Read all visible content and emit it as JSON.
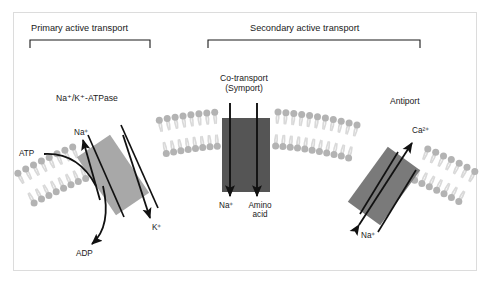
{
  "figure": {
    "background_color": "#ffffff",
    "border_color": "#dcdcdc"
  },
  "groups": [
    {
      "id": "primary",
      "label": "Primary active transport",
      "bracket": {
        "x1": 30,
        "x2": 150,
        "y": 40,
        "tick": 8
      }
    },
    {
      "id": "secondary",
      "label": "Secondary active transport",
      "bracket": {
        "x1": 208,
        "x2": 420,
        "y": 40,
        "tick": 8
      }
    }
  ],
  "proteins": [
    {
      "id": "na-k-atpase",
      "label": "Na⁺/K⁺-ATPase",
      "type": "pump",
      "color": "#a8a8a8",
      "label_x": 56,
      "label_y": 94
    },
    {
      "id": "symport",
      "label_line1": "Co-transport",
      "label_line2": "(Symport)",
      "type": "symporter",
      "color": "#555555",
      "label_x": 205,
      "label_y": 74
    },
    {
      "id": "antiport",
      "label": "Antiport",
      "type": "antiporter",
      "color": "#7a7a7a",
      "label_x": 390,
      "label_y": 97
    }
  ],
  "membrane": {
    "head_color": "#b3b3b3",
    "tail_color": "#d9d9d9",
    "description": "curved phospholipid bilayer arc"
  },
  "ions": [
    {
      "id": "atpase-na-out",
      "text": "Na⁺",
      "x": 74,
      "y": 128,
      "arrow": "up-left"
    },
    {
      "id": "atpase-k-in",
      "text": "K⁺",
      "x": 152,
      "y": 223,
      "arrow": "down-right"
    },
    {
      "id": "atp-in",
      "text": "ATP",
      "x": 19,
      "y": 155,
      "arrow": "curve-right"
    },
    {
      "id": "adp-out",
      "text": "ADP",
      "x": 76,
      "y": 249,
      "arrow": "curve-down"
    },
    {
      "id": "symport-na",
      "text": "Na⁺",
      "x": 219,
      "y": 201,
      "arrow": "down"
    },
    {
      "id": "symport-aa-line1",
      "text": "Amino",
      "x": 246,
      "y": 201,
      "arrow": "down"
    },
    {
      "id": "symport-aa-line2",
      "text": "acid",
      "x": 250,
      "y": 212,
      "arrow": "none"
    },
    {
      "id": "antiport-ca-out",
      "text": "Ca²⁺",
      "x": 412,
      "y": 131,
      "arrow": "up-right"
    },
    {
      "id": "antiport-na-in",
      "text": "Na⁺",
      "x": 361,
      "y": 236,
      "arrow": "down-left"
    }
  ],
  "colors": {
    "ink": "#1a1a1a",
    "protein_light": "#a8a8a8",
    "protein_mid": "#7a7a7a",
    "protein_dark": "#555555",
    "lipid_head": "#b3b3b3",
    "lipid_tail": "#d9d9d9"
  }
}
